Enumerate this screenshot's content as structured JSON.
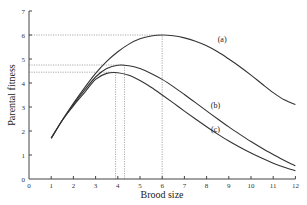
{
  "chart_data": {
    "type": "line",
    "title": "",
    "xlabel": "Brood size",
    "ylabel": "Parental fitness",
    "xlim": [
      0,
      12
    ],
    "ylim": [
      0,
      7
    ],
    "xticks": [
      0,
      1,
      2,
      3,
      4,
      5,
      6,
      7,
      8,
      9,
      10,
      11,
      12
    ],
    "yticks": [
      0,
      1,
      2,
      3,
      4,
      5,
      6,
      7
    ],
    "grid": false,
    "legend": "inline labels",
    "x": [
      1,
      1.5,
      2,
      2.5,
      3,
      3.5,
      4,
      4.5,
      5,
      5.5,
      6,
      6.5,
      7,
      7.5,
      8,
      8.5,
      9,
      9.5,
      10,
      10.5,
      11,
      11.5,
      12
    ],
    "series": [
      {
        "name": "(a)",
        "values": [
          1.7,
          2.45,
          3.15,
          3.8,
          4.4,
          4.9,
          5.3,
          5.62,
          5.84,
          5.96,
          6.0,
          5.97,
          5.88,
          5.74,
          5.55,
          5.3,
          5.0,
          4.68,
          4.33,
          3.96,
          3.6,
          3.3,
          3.1
        ],
        "peak": {
          "x": 6.0,
          "y": 6.0
        }
      },
      {
        "name": "(b)",
        "values": [
          1.7,
          2.45,
          3.1,
          3.7,
          4.25,
          4.6,
          4.74,
          4.72,
          4.6,
          4.4,
          4.15,
          3.85,
          3.52,
          3.18,
          2.84,
          2.5,
          2.17,
          1.86,
          1.56,
          1.28,
          1.02,
          0.77,
          0.55
        ],
        "peak": {
          "x": 4.3,
          "y": 4.75
        }
      },
      {
        "name": "(c)",
        "values": [
          1.7,
          2.45,
          3.05,
          3.6,
          4.15,
          4.4,
          4.43,
          4.32,
          4.1,
          3.82,
          3.5,
          3.17,
          2.83,
          2.5,
          2.18,
          1.87,
          1.58,
          1.32,
          1.08,
          0.86,
          0.66,
          0.49,
          0.35
        ],
        "peak": {
          "x": 3.9,
          "y": 4.45
        }
      }
    ],
    "reference_lines": [
      {
        "type": "horizontal",
        "y": 6.0,
        "x_to": 6.0,
        "style": "dotted"
      },
      {
        "type": "horizontal",
        "y": 4.75,
        "x_to": 4.3,
        "style": "dotted"
      },
      {
        "type": "horizontal",
        "y": 4.45,
        "x_to": 3.9,
        "style": "dotted"
      },
      {
        "type": "vertical",
        "x": 3.9,
        "y_to": 4.45,
        "style": "dotted"
      },
      {
        "type": "vertical",
        "x": 4.3,
        "y_to": 4.75,
        "style": "dotted"
      },
      {
        "type": "vertical",
        "x": 6.0,
        "y_to": 6.0,
        "style": "dotted"
      }
    ],
    "annotations": [
      {
        "text": "(a)",
        "x": 8.7,
        "y": 5.7
      },
      {
        "text": "(b)",
        "x": 8.4,
        "y": 2.95
      },
      {
        "text": "(c)",
        "x": 8.4,
        "y": 1.95
      }
    ]
  },
  "colors": {
    "line": "#333333",
    "axis": "#444444",
    "reference": "#888888"
  }
}
